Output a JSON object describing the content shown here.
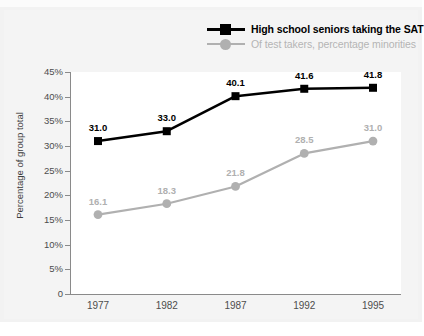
{
  "legend": {
    "items": [
      {
        "label": "High school seniors taking the SAT",
        "color": "#000000",
        "marker": "square"
      },
      {
        "label": "Of test takers, percentage minorities",
        "color": "#b0b0b0",
        "marker": "circle"
      }
    ]
  },
  "axis": {
    "ylabel": "Percentage of group total",
    "yticks": [
      "0",
      "5%",
      "10%",
      "15%",
      "20%",
      "25%",
      "30%",
      "35%",
      "40%",
      "45%"
    ],
    "xticks": [
      "1977",
      "1982",
      "1987",
      "1992",
      "1995"
    ]
  },
  "chart_data": {
    "type": "line",
    "title": "",
    "xlabel": "",
    "ylabel": "Percentage of group total",
    "categories": [
      "1977",
      "1982",
      "1987",
      "1992",
      "1995"
    ],
    "ylim": [
      0,
      45
    ],
    "ytick_values": [
      0,
      5,
      10,
      15,
      20,
      25,
      30,
      35,
      40,
      45
    ],
    "ytick_labels": [
      "0",
      "5%",
      "10%",
      "15%",
      "20%",
      "25%",
      "30%",
      "35%",
      "40%",
      "45%"
    ],
    "grid": false,
    "legend_position": "top-right",
    "series": [
      {
        "name": "High school seniors taking the SAT",
        "color": "#000000",
        "marker": "square",
        "values": [
          31.0,
          33.0,
          40.1,
          41.6,
          41.8
        ],
        "labels": [
          "31.0",
          "33.0",
          "40.1",
          "41.6",
          "41.8"
        ]
      },
      {
        "name": "Of test takers, percentage minorities",
        "color": "#b0b0b0",
        "marker": "circle",
        "values": [
          16.1,
          18.3,
          21.8,
          28.5,
          31.0
        ],
        "labels": [
          "16.1",
          "18.3",
          "21.8",
          "28.5",
          "31.0"
        ]
      }
    ]
  },
  "colors": {
    "card_background": "#f4f4f4",
    "plot_background": "#ffffff",
    "axis": "#8a8a8a",
    "series_primary": "#000000",
    "series_secondary": "#b0b0b0"
  }
}
